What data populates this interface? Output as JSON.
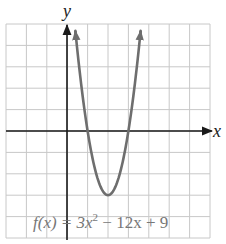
{
  "chart_data": {
    "type": "line",
    "title": "",
    "function": "f(x) = 3x^2 - 12x + 9",
    "xlabel": "x",
    "ylabel": "y",
    "xlim": [
      -3,
      7
    ],
    "ylim": [
      -5,
      5
    ],
    "grid": true,
    "grid_step": 1,
    "tick_labels_shown": false,
    "series": [
      {
        "name": "f(x) = 3x^2 - 12x + 9",
        "color": "#6e6e6e",
        "x": [
          0.4,
          0.6,
          0.8,
          1.0,
          1.2,
          1.4,
          1.6,
          1.8,
          2.0,
          2.2,
          2.4,
          2.6,
          2.8,
          3.0,
          3.2,
          3.4,
          3.6
        ],
        "y": [
          4.68,
          3.0,
          1.32,
          0.0,
          -0.84,
          -1.92,
          -2.52,
          -2.88,
          -3.0,
          -2.88,
          -2.52,
          -1.92,
          -0.84,
          0.0,
          1.32,
          3.0,
          4.68
        ]
      }
    ],
    "key_points": {
      "vertex": [
        2,
        -3
      ],
      "x_intercepts": [
        [
          1,
          0
        ],
        [
          3,
          0
        ]
      ],
      "y_intercept": [
        0,
        9
      ]
    },
    "annotations": [
      {
        "text": "f(x) = 3x² − 12x + 9",
        "position": "bottom-center"
      }
    ]
  },
  "labels": {
    "x_axis": "x",
    "y_axis": "y",
    "equation_prefix": "f(x) = 3x",
    "equation_exp": "2",
    "equation_suffix": " − 12x + 9"
  },
  "colors": {
    "grid": "#c8c8c8",
    "axis": "#1a1a1a",
    "curve": "#6e6e6e",
    "equation_text": "#777777"
  }
}
